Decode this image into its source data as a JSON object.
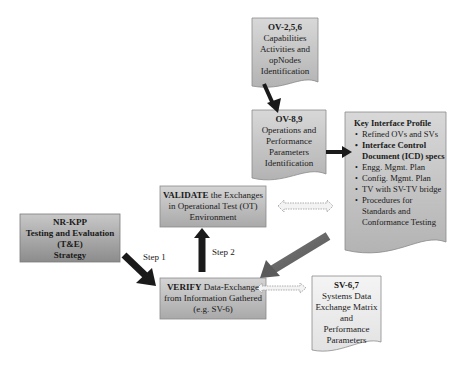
{
  "nodes": {
    "ov256": {
      "title": "OV-2,5,6",
      "lines": [
        "Capabilities",
        "Activities and",
        "opNodes",
        "Identification"
      ]
    },
    "ov89": {
      "title": "OV-8,9",
      "lines": [
        "Operations and",
        "Performance",
        "Parameters",
        "Identification"
      ]
    },
    "kip": {
      "title": "Key Interface Profile",
      "items": [
        {
          "text": "Refined OVs and SVs",
          "bold": false
        },
        {
          "text": "Interface Control Document (ICD) specs",
          "bold": true
        },
        {
          "text": "Engg. Mgmt. Plan",
          "bold": false
        },
        {
          "text": "Config. Mgmt. Plan",
          "bold": false
        },
        {
          "text": "TV with SV-TV bridge",
          "bold": false
        },
        {
          "text": "Procedures for Standards and Conformance Testing",
          "bold": false
        }
      ]
    },
    "validate": {
      "bold_word": "VALIDATE",
      "rest_first_line": " the Exchanges",
      "lines": [
        "in Operational Test (OT)",
        "Environment"
      ]
    },
    "nrkpp": {
      "lines": [
        "NR-KPP",
        "Testing and Evaluation",
        "(T&E)",
        "Strategy"
      ]
    },
    "verify": {
      "bold_word": "VERIFY",
      "rest_first_line": " Data-Exchange",
      "lines": [
        "from Information Gathered",
        "(e.g. SV-6)"
      ]
    },
    "sv67": {
      "title": "SV-6,7",
      "lines": [
        "Systems Data",
        "Exchange Matrix",
        "and",
        "Performance",
        "Parameters"
      ]
    }
  },
  "edges": {
    "step1_label": "Step 1",
    "step2_label": "Step 2"
  },
  "colors": {
    "box_fill_light": "#d9d9d9",
    "box_fill_dark": "#9a9a9a",
    "doc_fill": "#cfcfcf",
    "arrow_dark": "#1a1a1a",
    "arrow_gray": "#6e6e6e"
  }
}
